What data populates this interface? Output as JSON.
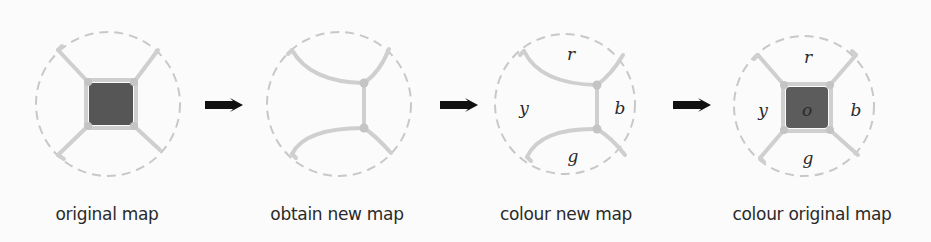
{
  "diagram": {
    "colors": {
      "boundary_dashed": "#c8c8c8",
      "edge": "#cfcfcf",
      "vertex": "#c4c4c4",
      "central_region": "#565656",
      "arrow": "#111111",
      "text": "#2a2a2a"
    },
    "steps": [
      {
        "label": "original map",
        "regions": []
      },
      {
        "label": "obtain new map",
        "regions": []
      },
      {
        "label": "colour new map",
        "regions": [
          "r",
          "y",
          "b",
          "g"
        ]
      },
      {
        "label": "colour original map",
        "regions": [
          "r",
          "y",
          "o",
          "b",
          "g"
        ]
      }
    ],
    "arrows": 3
  }
}
